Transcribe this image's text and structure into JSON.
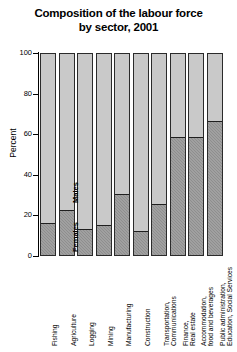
{
  "chart_data": {
    "type": "bar",
    "subtype": "stacked-100-percent",
    "title": "Composition of the labour force by sector, 2001",
    "title_lines": [
      "Composition of the labour force",
      "by sector, 2001"
    ],
    "xlabel": "",
    "ylabel": "Percent",
    "ylim": [
      0,
      100
    ],
    "yticks": [
      0,
      20,
      40,
      60,
      80,
      100
    ],
    "ytick_labels": [
      "0",
      "20",
      "40",
      "60",
      "80",
      "100"
    ],
    "grid": false,
    "legend": "in-bar annotations",
    "categories": [
      "Fishing",
      "Agriculture",
      "Logging",
      "Mining",
      "Manufacturing",
      "Construction",
      "Transportation, Communications",
      "Finance, Real estate",
      "Accommodation, food and beverages",
      "Public administration, Education, Social Services"
    ],
    "category_lines": [
      [
        "Fishing",
        ""
      ],
      [
        "Agriculture",
        ""
      ],
      [
        "Logging",
        ""
      ],
      [
        "Mining",
        ""
      ],
      [
        "Manufacturing",
        ""
      ],
      [
        "Construction",
        ""
      ],
      [
        "Transportation,",
        "Communications"
      ],
      [
        "Finance,",
        "Real estate"
      ],
      [
        "Accommodation,",
        "food and beverages"
      ],
      [
        "Public administration,",
        "Education, Social Services"
      ]
    ],
    "series": [
      {
        "name": "Females",
        "color": "#8e8e8e",
        "values": [
          16,
          22,
          13,
          15,
          30,
          12,
          25,
          58,
          58,
          66
        ]
      },
      {
        "name": "Males",
        "color": "#c9c9c9",
        "values": [
          84,
          78,
          87,
          85,
          70,
          88,
          75,
          42,
          42,
          34
        ]
      }
    ],
    "annotations": [
      {
        "text": "Females",
        "series": "Females",
        "category": "Agriculture"
      },
      {
        "text": "Males",
        "series": "Males",
        "category": "Agriculture"
      }
    ]
  },
  "colors": {
    "males": "#c9c9c9",
    "females": "#8e8e8e",
    "axis": "#000000",
    "bar_border": "#2b2b2b",
    "background": "#ffffff"
  }
}
